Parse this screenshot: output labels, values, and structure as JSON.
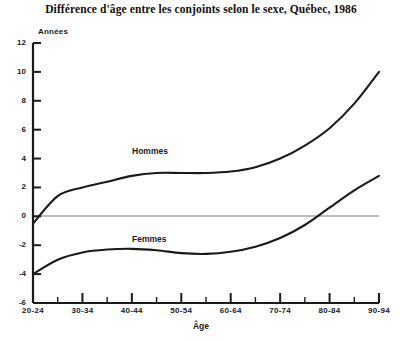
{
  "chart_data": {
    "type": "line",
    "title": "Différence d'âge entre les conjoints selon le sexe, Québec, 1986",
    "xlabel": "Âge",
    "ylabel": "Années",
    "ylim": [
      -6,
      12
    ],
    "yticks": [
      12,
      10,
      8,
      6,
      4,
      2,
      0,
      -2,
      -4,
      -6
    ],
    "grid": false,
    "zero_line": true,
    "legend_position": "inline-annotations",
    "categories": [
      "20-24",
      "25-29",
      "30-34",
      "35-39",
      "40-44",
      "45-49",
      "50-54",
      "55-59",
      "60-64",
      "65-69",
      "70-74",
      "75-79",
      "80-84",
      "85-89",
      "90-94"
    ],
    "xtick_labels": [
      "20-24",
      "30-34",
      "40-44",
      "50-54",
      "60-64",
      "70-74",
      "80-84",
      "90-94"
    ],
    "series": [
      {
        "name": "Hommes",
        "color": "#1a1a1a",
        "values": [
          -0.5,
          1.4,
          2.0,
          2.4,
          2.8,
          3.0,
          3.0,
          3.0,
          3.1,
          3.4,
          4.0,
          4.9,
          6.1,
          7.8,
          10.0
        ]
      },
      {
        "name": "Femmes",
        "color": "#1a1a1a",
        "values": [
          -4.0,
          -3.0,
          -2.5,
          -2.3,
          -2.25,
          -2.35,
          -2.55,
          -2.6,
          -2.45,
          -2.1,
          -1.5,
          -0.6,
          0.6,
          1.8,
          2.8
        ]
      }
    ],
    "annotations": [
      {
        "text": "Hommes",
        "x": 132,
        "y": 146
      },
      {
        "text": "Femmes",
        "x": 132,
        "y": 234
      }
    ]
  },
  "axes": {
    "y_unit_label": "Années",
    "x_title": "Âge"
  }
}
